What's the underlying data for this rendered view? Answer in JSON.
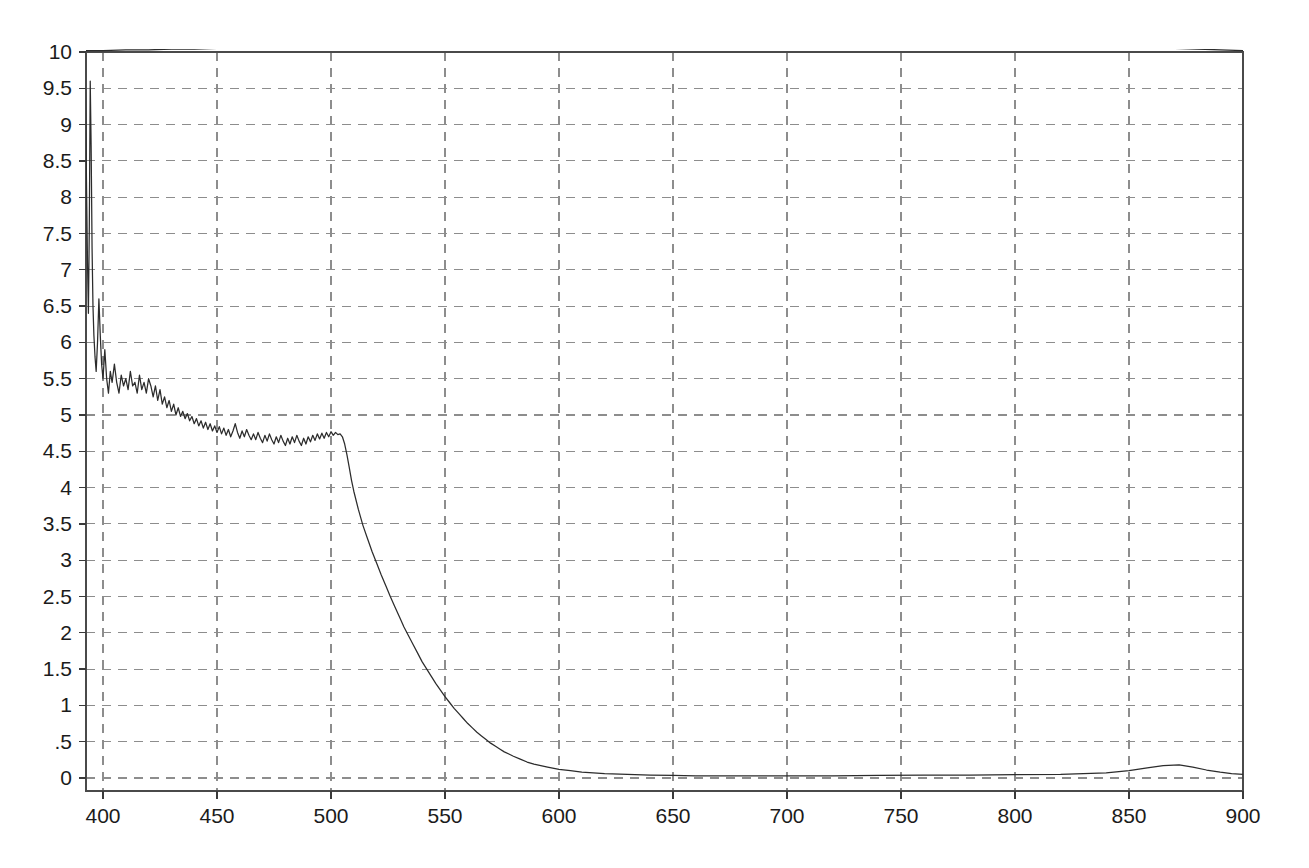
{
  "chart_data": {
    "type": "line",
    "title": "",
    "subtitle": "",
    "xlabel": "",
    "ylabel": "",
    "xlim": [
      392,
      900
    ],
    "ylim": [
      0,
      10
    ],
    "grid": true,
    "grid_style": "dashed",
    "legend": "none",
    "background": "#ffffff",
    "line_color": "#2c2c2c",
    "grid_color": "#8d8d8d",
    "axis_color": "#4a4a4a",
    "x_ticks": [
      400,
      450,
      500,
      550,
      600,
      650,
      700,
      750,
      800,
      850,
      900
    ],
    "x_tick_labels": [
      "400",
      "450",
      "500",
      "550",
      "600",
      "650",
      "700",
      "750",
      "800",
      "850",
      "900"
    ],
    "y_ticks": [
      0,
      0.5,
      1,
      1.5,
      2,
      2.5,
      3,
      3.5,
      4,
      4.5,
      5,
      5.5,
      6,
      6.5,
      7,
      7.5,
      8,
      8.5,
      9,
      9.5,
      10
    ],
    "y_tick_labels": [
      "0",
      ".5",
      "1",
      "1.5",
      "2",
      "2.5",
      "3",
      "3.5",
      "4",
      "4.5",
      "5",
      "5.5",
      "6",
      "6.5",
      "7",
      "7.5",
      "8",
      "8.5",
      "9",
      "9.5",
      "10"
    ],
    "series": [
      {
        "name": "upper-trace",
        "color": "#2c2c2c",
        "points": [
          [
            392,
            10.02
          ],
          [
            400,
            10.02
          ],
          [
            410,
            10.03
          ],
          [
            420,
            10.03
          ],
          [
            430,
            10.04
          ],
          [
            440,
            10.04
          ],
          [
            450,
            10.05
          ],
          [
            460,
            10.05
          ],
          [
            470,
            10.06
          ],
          [
            480,
            10.06
          ],
          [
            490,
            10.07
          ],
          [
            500,
            10.07
          ],
          [
            510,
            10.08
          ],
          [
            520,
            10.08
          ],
          [
            530,
            10.09
          ],
          [
            540,
            10.1
          ],
          [
            550,
            10.1
          ],
          [
            560,
            10.11
          ],
          [
            570,
            10.12
          ],
          [
            580,
            10.12
          ],
          [
            590,
            10.13
          ],
          [
            600,
            10.14
          ],
          [
            610,
            10.15
          ],
          [
            620,
            10.16
          ],
          [
            630,
            10.17
          ],
          [
            640,
            10.18
          ],
          [
            650,
            10.19
          ],
          [
            660,
            10.2
          ],
          [
            670,
            10.21
          ],
          [
            680,
            10.22
          ],
          [
            690,
            10.23
          ],
          [
            700,
            10.24
          ],
          [
            710,
            10.25
          ],
          [
            720,
            10.26
          ],
          [
            730,
            10.27
          ],
          [
            740,
            10.28
          ],
          [
            750,
            10.28
          ],
          [
            760,
            10.27
          ],
          [
            770,
            10.25
          ],
          [
            780,
            10.22
          ],
          [
            790,
            10.19
          ],
          [
            800,
            10.16
          ],
          [
            810,
            10.14
          ],
          [
            820,
            10.12
          ],
          [
            830,
            10.1
          ],
          [
            840,
            10.08
          ],
          [
            850,
            10.07
          ],
          [
            860,
            10.06
          ],
          [
            870,
            10.05
          ],
          [
            880,
            10.04
          ],
          [
            890,
            10.03
          ],
          [
            900,
            10.02
          ]
        ]
      },
      {
        "name": "lower-trace",
        "color": "#2c2c2c",
        "points": [
          [
            392.0,
            10.0
          ],
          [
            392.4,
            9.2
          ],
          [
            392.8,
            8.1
          ],
          [
            393.2,
            7.1
          ],
          [
            393.6,
            6.4
          ],
          [
            394.0,
            7.6
          ],
          [
            394.4,
            9.6
          ],
          [
            394.8,
            8.7
          ],
          [
            395.2,
            7.3
          ],
          [
            395.6,
            6.5
          ],
          [
            396.0,
            6.1
          ],
          [
            396.5,
            5.8
          ],
          [
            397.0,
            5.6
          ],
          [
            397.6,
            6.0
          ],
          [
            398.2,
            6.6
          ],
          [
            398.8,
            6.1
          ],
          [
            399.4,
            5.7
          ],
          [
            400.0,
            5.5
          ],
          [
            400.8,
            5.9
          ],
          [
            401.6,
            5.5
          ],
          [
            402.4,
            5.3
          ],
          [
            403.2,
            5.6
          ],
          [
            404.0,
            5.45
          ],
          [
            405.0,
            5.7
          ],
          [
            406.0,
            5.45
          ],
          [
            407.0,
            5.3
          ],
          [
            408.0,
            5.55
          ],
          [
            409.0,
            5.4
          ],
          [
            410.0,
            5.5
          ],
          [
            411.0,
            5.35
          ],
          [
            412.0,
            5.6
          ],
          [
            413.0,
            5.4
          ],
          [
            414.0,
            5.45
          ],
          [
            415.0,
            5.3
          ],
          [
            416.0,
            5.55
          ],
          [
            417.0,
            5.35
          ],
          [
            418.0,
            5.45
          ],
          [
            419.0,
            5.3
          ],
          [
            420.0,
            5.5
          ],
          [
            421.0,
            5.4
          ],
          [
            422.0,
            5.25
          ],
          [
            423.0,
            5.4
          ],
          [
            424.0,
            5.2
          ],
          [
            425.0,
            5.35
          ],
          [
            426.0,
            5.15
          ],
          [
            427.0,
            5.25
          ],
          [
            428.0,
            5.1
          ],
          [
            429.0,
            5.2
          ],
          [
            430.0,
            5.05
          ],
          [
            431.0,
            5.15
          ],
          [
            432.0,
            5.0
          ],
          [
            433.0,
            5.1
          ],
          [
            434.0,
            4.98
          ],
          [
            435.0,
            5.05
          ],
          [
            436.0,
            4.95
          ],
          [
            437.0,
            5.02
          ],
          [
            438.0,
            4.92
          ],
          [
            439.0,
            4.98
          ],
          [
            440.0,
            4.88
          ],
          [
            441.0,
            4.95
          ],
          [
            442.0,
            4.85
          ],
          [
            443.0,
            4.92
          ],
          [
            444.0,
            4.82
          ],
          [
            445.0,
            4.9
          ],
          [
            446.0,
            4.8
          ],
          [
            447.0,
            4.88
          ],
          [
            448.0,
            4.78
          ],
          [
            449.0,
            4.85
          ],
          [
            450.0,
            4.76
          ],
          [
            451.0,
            4.84
          ],
          [
            452.0,
            4.74
          ],
          [
            453.0,
            4.82
          ],
          [
            454.0,
            4.72
          ],
          [
            455.0,
            4.8
          ],
          [
            456.0,
            4.7
          ],
          [
            457.0,
            4.78
          ],
          [
            458.0,
            4.88
          ],
          [
            459.0,
            4.76
          ],
          [
            460.0,
            4.68
          ],
          [
            461.0,
            4.78
          ],
          [
            462.0,
            4.7
          ],
          [
            463.0,
            4.8
          ],
          [
            464.0,
            4.72
          ],
          [
            465.0,
            4.66
          ],
          [
            466.0,
            4.74
          ],
          [
            467.0,
            4.66
          ],
          [
            468.0,
            4.76
          ],
          [
            469.0,
            4.68
          ],
          [
            470.0,
            4.62
          ],
          [
            471.0,
            4.72
          ],
          [
            472.0,
            4.64
          ],
          [
            473.0,
            4.74
          ],
          [
            474.0,
            4.66
          ],
          [
            475.0,
            4.6
          ],
          [
            476.0,
            4.7
          ],
          [
            477.0,
            4.62
          ],
          [
            478.0,
            4.72
          ],
          [
            479.0,
            4.64
          ],
          [
            480.0,
            4.58
          ],
          [
            481.0,
            4.68
          ],
          [
            482.0,
            4.6
          ],
          [
            483.0,
            4.7
          ],
          [
            484.0,
            4.62
          ],
          [
            485.0,
            4.72
          ],
          [
            486.0,
            4.64
          ],
          [
            487.0,
            4.58
          ],
          [
            488.0,
            4.68
          ],
          [
            489.0,
            4.6
          ],
          [
            490.0,
            4.7
          ],
          [
            491.0,
            4.63
          ],
          [
            492.0,
            4.72
          ],
          [
            493.0,
            4.65
          ],
          [
            494.0,
            4.74
          ],
          [
            495.0,
            4.67
          ],
          [
            496.0,
            4.75
          ],
          [
            497.0,
            4.68
          ],
          [
            498.0,
            4.76
          ],
          [
            499.0,
            4.7
          ],
          [
            500.0,
            4.77
          ],
          [
            501.0,
            4.72
          ],
          [
            502.0,
            4.76
          ],
          [
            503.0,
            4.73
          ],
          [
            504.0,
            4.74
          ],
          [
            505.0,
            4.7
          ],
          [
            506.0,
            4.6
          ],
          [
            507.0,
            4.45
          ],
          [
            508.0,
            4.28
          ],
          [
            509.0,
            4.1
          ],
          [
            510.0,
            3.95
          ],
          [
            512.0,
            3.7
          ],
          [
            514.0,
            3.48
          ],
          [
            516.0,
            3.3
          ],
          [
            518.0,
            3.12
          ],
          [
            520.0,
            2.96
          ],
          [
            522.0,
            2.8
          ],
          [
            524.0,
            2.65
          ],
          [
            526.0,
            2.5
          ],
          [
            528.0,
            2.36
          ],
          [
            530.0,
            2.22
          ],
          [
            532.0,
            2.08
          ],
          [
            534.0,
            1.96
          ],
          [
            536.0,
            1.84
          ],
          [
            538.0,
            1.72
          ],
          [
            540.0,
            1.6
          ],
          [
            542.0,
            1.5
          ],
          [
            544.0,
            1.4
          ],
          [
            546.0,
            1.3
          ],
          [
            548.0,
            1.21
          ],
          [
            550.0,
            1.12
          ],
          [
            552.0,
            1.04
          ],
          [
            554.0,
            0.96
          ],
          [
            556.0,
            0.89
          ],
          [
            558.0,
            0.82
          ],
          [
            560.0,
            0.75
          ],
          [
            562.0,
            0.69
          ],
          [
            564.0,
            0.63
          ],
          [
            566.0,
            0.58
          ],
          [
            568.0,
            0.53
          ],
          [
            570.0,
            0.48
          ],
          [
            572.0,
            0.44
          ],
          [
            574.0,
            0.4
          ],
          [
            576.0,
            0.36
          ],
          [
            578.0,
            0.33
          ],
          [
            580.0,
            0.3
          ],
          [
            583.0,
            0.26
          ],
          [
            586.0,
            0.22
          ],
          [
            589.0,
            0.19
          ],
          [
            592.0,
            0.17
          ],
          [
            595.0,
            0.15
          ],
          [
            600.0,
            0.12
          ],
          [
            605.0,
            0.1
          ],
          [
            610.0,
            0.08
          ],
          [
            615.0,
            0.07
          ],
          [
            620.0,
            0.06
          ],
          [
            630.0,
            0.05
          ],
          [
            640.0,
            0.04
          ],
          [
            650.0,
            0.035
          ],
          [
            660.0,
            0.03
          ],
          [
            680.0,
            0.03
          ],
          [
            700.0,
            0.03
          ],
          [
            720.0,
            0.03
          ],
          [
            740.0,
            0.035
          ],
          [
            760.0,
            0.04
          ],
          [
            780.0,
            0.04
          ],
          [
            800.0,
            0.045
          ],
          [
            820.0,
            0.05
          ],
          [
            840.0,
            0.07
          ],
          [
            850.0,
            0.1
          ],
          [
            858.0,
            0.14
          ],
          [
            865.0,
            0.17
          ],
          [
            872.0,
            0.18
          ],
          [
            878.0,
            0.15
          ],
          [
            884.0,
            0.11
          ],
          [
            890.0,
            0.08
          ],
          [
            895.0,
            0.06
          ],
          [
            900.0,
            0.05
          ]
        ]
      }
    ]
  }
}
